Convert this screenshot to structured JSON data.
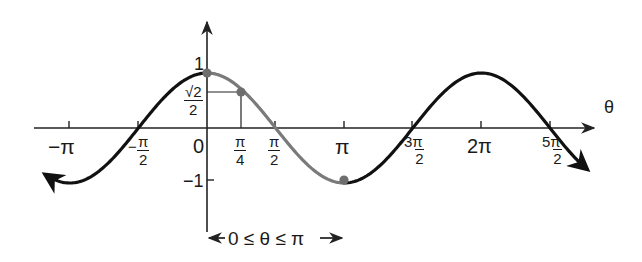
{
  "chart_data": {
    "type": "line",
    "title": "",
    "function": "y = cos(θ)",
    "xlabel": "θ",
    "ylabel": "",
    "x_ticks": [
      "−π",
      "−π/2",
      "0",
      "π/4",
      "π/2",
      "π",
      "3π/2",
      "2π",
      "5π/2"
    ],
    "x_tick_values": [
      -3.14159,
      -1.5708,
      0,
      0.7854,
      1.5708,
      3.14159,
      4.71239,
      6.28319,
      7.85398
    ],
    "y_ticks": [
      "1",
      "√2/2",
      "−1"
    ],
    "y_tick_values": [
      1,
      0.7071,
      -1
    ],
    "xlim": [
      -3.7,
      8.7
    ],
    "ylim": [
      -1,
      1
    ],
    "grid": false,
    "series": [
      {
        "name": "cos θ (full)",
        "color": "#111111",
        "x_range": [
          -3.7,
          8.7
        ]
      },
      {
        "name": "cos θ, 0 ≤ θ ≤ π (highlighted)",
        "color": "#7a7a7a",
        "x_range": [
          0,
          3.14159
        ]
      }
    ],
    "points": [
      {
        "label": "(0, 1)",
        "x": 0,
        "y": 1
      },
      {
        "label": "(π/4, √2/2)",
        "x": 0.7854,
        "y": 0.7071
      },
      {
        "label": "(π, −1)",
        "x": 3.14159,
        "y": -1
      }
    ],
    "annotations": [
      "0 ≤ θ ≤ π"
    ]
  },
  "labels": {
    "axis_theta": "θ",
    "y_one": "1",
    "y_neg_one": "−1",
    "y_sqrt2_num": "√2",
    "y_sqrt2_den": "2",
    "x_neg_pi": "−π",
    "x_neg_half_pi_num": "π",
    "x_neg_half_pi_den": "2",
    "x_neg_half_pi_sign": "−",
    "x_zero": "0",
    "x_quarter_pi_num": "π",
    "x_quarter_pi_den": "4",
    "x_half_pi_num": "π",
    "x_half_pi_den": "2",
    "x_pi": "π",
    "x_three_half_pi_num": "3π",
    "x_three_half_pi_den": "2",
    "x_two_pi": "2π",
    "x_five_half_pi_num": "5π",
    "x_five_half_pi_den": "2",
    "interval": "0 ≤ θ ≤ π"
  },
  "colors": {
    "curve": "#111111",
    "highlight": "#7a7a7a",
    "axis": "#222222",
    "point": "#6e6e6e"
  }
}
